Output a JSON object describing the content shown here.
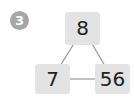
{
  "problem": {
    "number": "3",
    "top_value": "8",
    "left_value": "7",
    "right_value": "56"
  },
  "colors": {
    "badge": "#a6a6a6",
    "box": "#e3e3e3",
    "line": "#999999",
    "text": "#222222"
  }
}
